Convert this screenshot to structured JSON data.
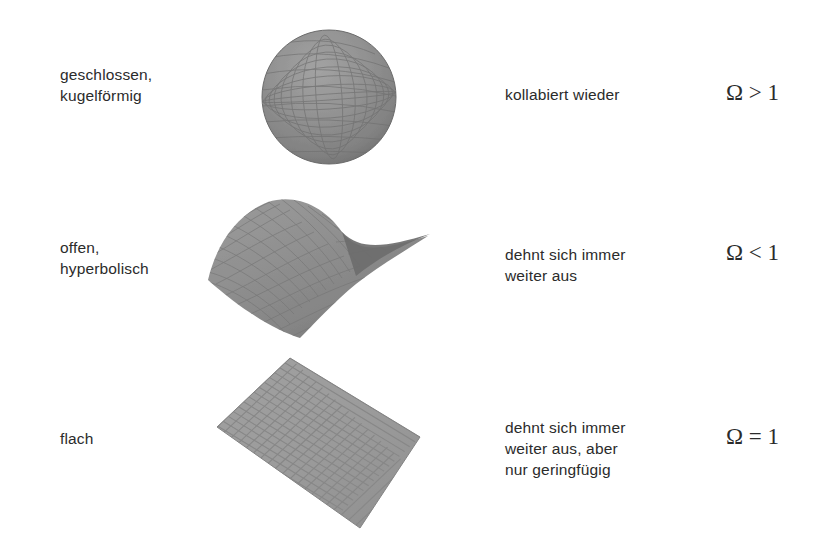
{
  "diagram": {
    "title_visible": false,
    "background_color": "#ffffff",
    "text_color": "#2b2b2b",
    "rows": [
      {
        "id": "closed",
        "label": "geschlossen,\nkugelförmig",
        "description": "kollabiert wieder",
        "formula": "Ω > 1",
        "figure_name": "sphere",
        "figure_kind": "shaded-wireframe-sphere",
        "surface_color": "#8d8d8d",
        "grid_color": "#6f6f6f"
      },
      {
        "id": "open",
        "label": "offen,\nhyperbolisch",
        "description": "dehnt sich immer\nweiter aus",
        "formula": "Ω < 1",
        "figure_name": "saddle",
        "figure_kind": "hyperbolic-paraboloid-mesh",
        "surface_color": "#909090",
        "grid_color": "#787878"
      },
      {
        "id": "flat",
        "label": "flach",
        "description": "dehnt sich immer\nweiter aus, aber\nnur geringfügig",
        "formula": "Ω = 1",
        "figure_name": "plane",
        "figure_kind": "flat-grid-plane",
        "surface_color": "#9b9b9b",
        "grid_color": "#868686"
      }
    ]
  }
}
